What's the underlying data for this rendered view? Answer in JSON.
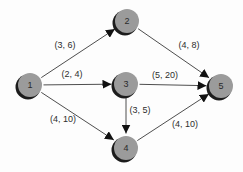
{
  "diagram": {
    "type": "directed-network",
    "colors": {
      "background": "#fdfdfd",
      "node_fill": "#9b9b9b",
      "node_shadow": "#1c1c1c",
      "edge": "#3a3a3a",
      "text": "#2e2e2e"
    },
    "nodes": [
      {
        "id": "1",
        "label": "1",
        "x": 30,
        "y": 85
      },
      {
        "id": "2",
        "label": "2",
        "x": 127,
        "y": 21
      },
      {
        "id": "3",
        "label": "3",
        "x": 126,
        "y": 84
      },
      {
        "id": "4",
        "label": "4",
        "x": 126,
        "y": 148
      },
      {
        "id": "5",
        "label": "5",
        "x": 221,
        "y": 86
      }
    ],
    "edges": [
      {
        "from": "1",
        "to": "2",
        "label": "(3, 6)",
        "label_x": 65,
        "label_y": 45
      },
      {
        "from": "1",
        "to": "3",
        "label": "(2, 4)",
        "label_x": 72,
        "label_y": 74
      },
      {
        "from": "1",
        "to": "4",
        "label": "(4, 10)",
        "label_x": 63,
        "label_y": 119
      },
      {
        "from": "2",
        "to": "5",
        "label": "(4, 8)",
        "label_x": 189,
        "label_y": 45
      },
      {
        "from": "3",
        "to": "5",
        "label": "(5, 20)",
        "label_x": 165,
        "label_y": 75
      },
      {
        "from": "3",
        "to": "4",
        "label": "(3, 5)",
        "label_x": 140,
        "label_y": 110
      },
      {
        "from": "4",
        "to": "5",
        "label": "(4, 10)",
        "label_x": 185,
        "label_y": 124
      }
    ]
  }
}
